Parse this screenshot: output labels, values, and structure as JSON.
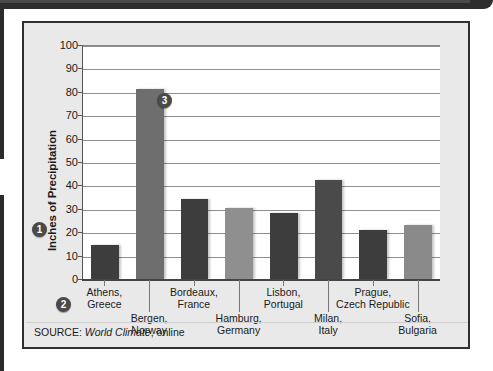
{
  "figure": {
    "source_label": "SOURCE:",
    "source_work": "World Climate",
    "source_suffix": ", online"
  },
  "markers": [
    {
      "id": "1",
      "label": "1",
      "refers_to": "y-axis-label"
    },
    {
      "id": "2",
      "label": "2",
      "refers_to": "x-axis-categories"
    },
    {
      "id": "3",
      "label": "3",
      "refers_to": "plot-area-bars"
    }
  ],
  "chart_data": {
    "type": "bar",
    "title": "",
    "xlabel": "",
    "ylabel": "Inches of Precipitation",
    "ylim": [
      0,
      100
    ],
    "ytick_step": 10,
    "yticks": [
      100,
      90,
      80,
      70,
      60,
      50,
      40,
      30,
      20,
      10,
      0
    ],
    "grid": true,
    "legend": "none",
    "categories": [
      "Athens, Greece",
      "Bergen, Norway",
      "Bordeaux, France",
      "Hamburg, Germany",
      "Lisbon, Portugal",
      "Milan, Italy",
      "Prague, Czech Republic",
      "Sofia, Bulgaria"
    ],
    "category_lines": [
      [
        "Athens,",
        "Greece"
      ],
      [
        "Bergen,",
        "Norway"
      ],
      [
        "Bordeaux,",
        "France"
      ],
      [
        "Hamburg,",
        "Germany"
      ],
      [
        "Lisbon,",
        "Portugal"
      ],
      [
        "Milan,",
        "Italy"
      ],
      [
        "Prague,",
        "Czech Republic"
      ],
      [
        "Sofia,",
        "Bulgaria"
      ]
    ],
    "values": [
      14.5,
      81,
      34,
      30.5,
      28,
      42.5,
      21,
      23
    ],
    "bar_colors": [
      "#3d3d3d",
      "#6e6e6e",
      "#3d3d3d",
      "#8f8f8f",
      "#3d3d3d",
      "#4a4a4a",
      "#3d3d3d",
      "#8a8a8a"
    ]
  }
}
